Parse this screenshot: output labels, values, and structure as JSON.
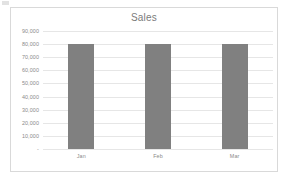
{
  "chart_data": {
    "type": "bar",
    "title": "Sales",
    "categories": [
      "Jan",
      "Feb",
      "Mar"
    ],
    "values": [
      80000,
      80000,
      80000
    ],
    "series": [
      {
        "name": "Sales",
        "values": [
          80000,
          80000,
          80000
        ]
      }
    ],
    "xlabel": "",
    "ylabel": "",
    "ylim": [
      0,
      90000
    ],
    "ytick_values": [
      90000,
      80000,
      70000,
      60000,
      50000,
      40000,
      30000,
      20000,
      10000,
      0
    ],
    "ytick_labels": [
      "90,000",
      "80,000",
      "70,000",
      "60,000",
      "50,000",
      "40,000",
      "30,000",
      "20,000",
      "10,000",
      "-"
    ],
    "grid": true,
    "legend": false,
    "bar_color": "#808080",
    "gridline_color": "#e6e6e6",
    "axis_text_color": "#8a8a8a",
    "title_color": "#7b7b7b",
    "frame_border_color": "#d9d9d9",
    "background_color": "#ffffff"
  }
}
